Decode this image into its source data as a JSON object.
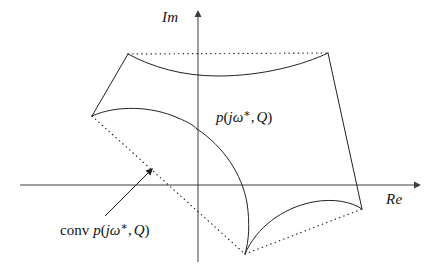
{
  "figure": {
    "type": "complex-plane-value-set-diagram",
    "background_color": "#ffffff",
    "line_color": "#222222",
    "axis_color": "#3c3c3c",
    "axes": {
      "imaginary": {
        "label": "Im",
        "orientation": "vertical",
        "arrow": "up",
        "x": 198,
        "y_top": 12,
        "y_bottom": 262
      },
      "real": {
        "label": "Re",
        "orientation": "horizontal",
        "arrow": "right",
        "y": 185,
        "x_left": 20,
        "x_right": 418
      },
      "origin": {
        "x": 198,
        "y": 185
      }
    },
    "labels": {
      "imaginary_axis": "Im",
      "real_axis": "Re",
      "value_set": {
        "p": "p",
        "open_paren": "(",
        "j": "j",
        "omega": "ω",
        "star": "∗",
        "comma": ",",
        "Q": "Q",
        "close_paren": ")",
        "plain": "p(jω*, Q)"
      },
      "convex_hull": {
        "conv": "conv",
        "p": "p",
        "open_paren": "(",
        "j": "j",
        "omega": "ω",
        "star": "∗",
        "comma": ",",
        "Q": "Q",
        "close_paren": ")",
        "plain": "conv p(jω*, Q)"
      }
    },
    "vertices": {
      "top_left": {
        "x": 128,
        "y": 54
      },
      "top_right": {
        "x": 328,
        "y": 53
      },
      "left": {
        "x": 92,
        "y": 116
      },
      "bottom": {
        "x": 245,
        "y": 254
      },
      "bottom_right": {
        "x": 362,
        "y": 209
      }
    },
    "solid_edges": [
      {
        "name": "top-left-to-left-vertex",
        "path": "M128,54 L92,116"
      },
      {
        "name": "top-right-to-bottom-right",
        "path": "M328,53 L362,209"
      },
      {
        "name": "top-concave-curve",
        "path": "M128,54 C170,76 225,80 275,71 C300,66 317,59 328,53"
      },
      {
        "name": "left-concave-curve",
        "path": "M92,116 C130,108 168,113 196,128"
      },
      {
        "name": "interior-bulge-curve",
        "path": "M196,128 C224,143 243,170 248,200 C251,222 249,242 245,254"
      },
      {
        "name": "bottom-concave-curve",
        "path": "M245,254 C259,225 286,206 318,201 C338,199 353,203 362,209"
      }
    ],
    "dotted_hull_edges": [
      {
        "name": "hull-top",
        "path": "M128,54 L328,53"
      },
      {
        "name": "hull-left-lower",
        "path": "M92,116 L245,254"
      },
      {
        "name": "hull-bottom-right",
        "path": "M245,254 L362,209"
      }
    ],
    "pointer": {
      "name": "conv-label-pointer",
      "from": {
        "x": 105,
        "y": 216
      },
      "to": {
        "x": 152,
        "y": 169
      }
    }
  }
}
